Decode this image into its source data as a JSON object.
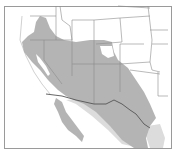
{
  "map": {
    "title": "",
    "subject": "species range map",
    "region": "Western United States and northwestern Mexico",
    "colors": {
      "background": "#ffffff",
      "frame": "#9a9a9a",
      "range_primary": "#b4b4b4",
      "range_secondary": "#dcdcdc",
      "state_borders": "#8c8c8c",
      "international_border": "#555555"
    },
    "layers": [
      {
        "id": "range-primary",
        "label": "Primary range",
        "description": "Southwest US deserts, Great Basin, southern California, Arizona, New Mexico, west Texas, northern Mexico, Baja California"
      },
      {
        "id": "range-secondary",
        "label": "Secondary range",
        "description": "Lighter band in Sonora/Sinaloa and south Texas coast"
      }
    ]
  }
}
